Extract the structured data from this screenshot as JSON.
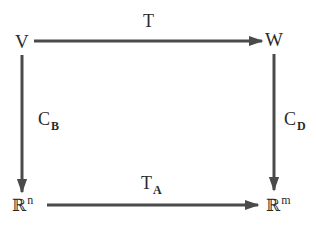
{
  "diagram": {
    "type": "commutative-diagram",
    "nodes": {
      "top_left": {
        "label": "V"
      },
      "top_right": {
        "label": "W"
      },
      "bottom_left": {
        "base": "ℝ",
        "superscript": "n"
      },
      "bottom_right": {
        "base": "ℝ",
        "superscript": "m"
      }
    },
    "arrows": {
      "top": {
        "label": "T",
        "from": "V",
        "to": "W"
      },
      "left": {
        "label": "C",
        "subscript": "B",
        "from": "V",
        "to": "ℝⁿ"
      },
      "right": {
        "label": "C",
        "subscript": "D",
        "from": "W",
        "to": "ℝᵐ"
      },
      "bottom": {
        "label": "T",
        "subscript": "A",
        "from": "ℝⁿ",
        "to": "ℝᵐ"
      }
    },
    "colors": {
      "line": "#4a4a4a",
      "text": "#2a2a2a",
      "background": "#ffffff"
    }
  }
}
